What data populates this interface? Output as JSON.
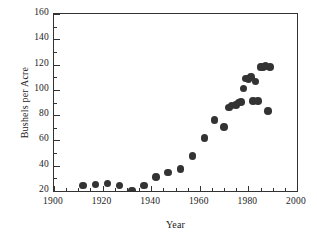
{
  "chart_data": {
    "type": "scatter",
    "title": "",
    "xlabel": "Year",
    "ylabel": "Bushels per Acre",
    "xlim": [
      1900,
      2000
    ],
    "ylim": [
      20,
      160
    ],
    "grid": false,
    "legend": null,
    "marker": {
      "shape": "circle",
      "color": "#333333",
      "size_px": 7.6
    },
    "xticks": [
      1900,
      1920,
      1940,
      1960,
      1980,
      2000
    ],
    "xtick_labels": [
      "1900",
      "1920",
      "1940",
      "1960",
      "1980",
      "2000"
    ],
    "xminor_step": 5,
    "yticks": [
      20,
      40,
      60,
      80,
      100,
      120,
      140,
      160
    ],
    "ytick_labels": [
      "20",
      "40",
      "60",
      "80",
      "100",
      "120",
      "140",
      "160"
    ],
    "yminor_step": 10,
    "series": [
      {
        "name": "Corn yield",
        "x": [
          1912,
          1917,
          1922,
          1927,
          1932,
          1937,
          1942,
          1947,
          1952,
          1957,
          1962,
          1966,
          1970,
          1972,
          1973,
          1975,
          1976,
          1977,
          1978,
          1979,
          1980,
          1981,
          1982,
          1983,
          1984,
          1985,
          1986,
          1987,
          1988,
          1989
        ],
        "y": [
          24.5,
          25.0,
          26.0,
          24.5,
          20.5,
          24.5,
          31.0,
          34.5,
          37.5,
          47.5,
          62.0,
          76.0,
          70.5,
          86.0,
          87.5,
          88.0,
          90.0,
          90.5,
          101.0,
          109.0,
          108.5,
          110.0,
          91.0,
          106.5,
          91.0,
          118.0,
          118.0,
          119.0,
          83.5,
          118.0
        ]
      }
    ]
  },
  "axes": {
    "y_title": "Bushels per Acre",
    "x_title": "Year"
  }
}
